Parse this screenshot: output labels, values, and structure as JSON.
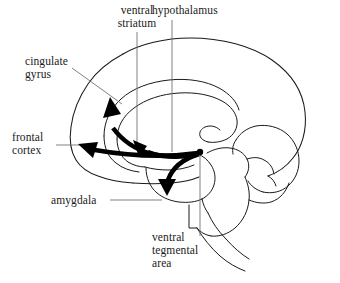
{
  "figure": {
    "name": "brain-dopamine-pathways-diagram",
    "background_color": "#ffffff",
    "ink_color": "#1a1a1a",
    "arrow_color": "#000000",
    "leader_color": "#6a6a6a"
  },
  "labels": {
    "ventral_striatum": "ventral\nstriatum",
    "hypothalamus": "hypothalamus",
    "cingulate_gyrus": "cingulate\ngyrus",
    "frontal_cortex": "frontal\ncortex",
    "amygdala": "amygdala",
    "ventral_tegmental_area": "ventral\ntegmental\narea"
  },
  "structures": [
    {
      "id": "cerebral-cortex-outline",
      "label": "cerebral cortex outline"
    },
    {
      "id": "corpus-callosum",
      "label": "corpus callosum"
    },
    {
      "id": "cingulate-gyrus-band",
      "label": "cingulate gyrus band"
    },
    {
      "id": "thalamus-region",
      "label": "thalamus region"
    },
    {
      "id": "cerebellum",
      "label": "cerebellum"
    },
    {
      "id": "brainstem",
      "label": "brainstem"
    }
  ],
  "pathways": [
    {
      "id": "vta-to-frontal-cortex",
      "target": "frontal cortex",
      "direction": "left"
    },
    {
      "id": "vta-to-cingulate-gyrus",
      "target": "cingulate gyrus",
      "direction": "up-left"
    },
    {
      "id": "vta-to-ventral-striatum",
      "target": "ventral striatum",
      "direction": "up"
    },
    {
      "id": "vta-to-amygdala",
      "target": "amygdala",
      "direction": "down"
    }
  ],
  "origin": {
    "id": "ventral-tegmental-area-hub",
    "label": "ventral tegmental area origin point"
  }
}
